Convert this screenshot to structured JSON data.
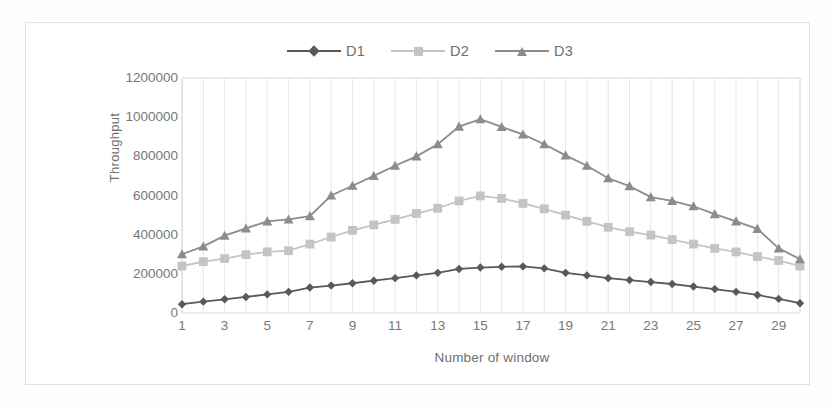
{
  "chart_data": {
    "type": "line",
    "title": "",
    "xlabel": "Number of window",
    "ylabel": "Throughput",
    "ylim": [
      0,
      1200000
    ],
    "ytick_labels": [
      "0",
      "200000",
      "400000",
      "600000",
      "800000",
      "1000000",
      "1200000"
    ],
    "ytick_values": [
      0,
      200000,
      400000,
      600000,
      800000,
      1000000,
      1200000
    ],
    "grid": "vertical",
    "legend_position": "top-center",
    "x": [
      1,
      2,
      3,
      4,
      5,
      6,
      7,
      8,
      9,
      10,
      11,
      12,
      13,
      14,
      15,
      16,
      17,
      18,
      19,
      20,
      21,
      22,
      23,
      24,
      25,
      26,
      27,
      28,
      29,
      30
    ],
    "xtick_labels": [
      "1",
      "3",
      "5",
      "7",
      "9",
      "11",
      "13",
      "15",
      "17",
      "19",
      "21",
      "23",
      "25",
      "27",
      "29"
    ],
    "xtick_values": [
      1,
      3,
      5,
      7,
      9,
      11,
      13,
      15,
      17,
      19,
      21,
      23,
      25,
      27,
      29
    ],
    "series": [
      {
        "name": "D1",
        "marker": "diamond",
        "color": "#595959",
        "values": [
          45000,
          58000,
          70000,
          82000,
          95000,
          108000,
          130000,
          140000,
          152000,
          165000,
          178000,
          192000,
          205000,
          225000,
          232000,
          236000,
          238000,
          228000,
          205000,
          192000,
          178000,
          168000,
          158000,
          148000,
          135000,
          122000,
          108000,
          92000,
          72000,
          50000
        ]
      },
      {
        "name": "D2",
        "marker": "square",
        "color": "#c4c4c4",
        "values": [
          240000,
          262000,
          278000,
          298000,
          312000,
          318000,
          352000,
          388000,
          422000,
          450000,
          478000,
          508000,
          535000,
          572000,
          598000,
          585000,
          560000,
          532000,
          500000,
          468000,
          438000,
          415000,
          398000,
          375000,
          352000,
          330000,
          312000,
          288000,
          268000,
          240000
        ]
      },
      {
        "name": "D3",
        "marker": "triangle",
        "color": "#8c8c8c",
        "values": [
          300000,
          340000,
          395000,
          432000,
          468000,
          478000,
          495000,
          600000,
          650000,
          700000,
          752000,
          800000,
          862000,
          952000,
          990000,
          950000,
          912000,
          862000,
          805000,
          752000,
          688000,
          648000,
          592000,
          572000,
          545000,
          505000,
          468000,
          430000,
          330000,
          275000
        ]
      }
    ]
  },
  "legend": {
    "entries": [
      {
        "label": "D1"
      },
      {
        "label": "D2"
      },
      {
        "label": "D3"
      }
    ]
  },
  "colors": {
    "d1": "#595959",
    "d2": "#c4c4c4",
    "d3": "#8c8c8c",
    "axis": "#d9d9d9",
    "grid": "#e6e6e6",
    "text": "#777777",
    "frame": "#e2e2e2"
  }
}
